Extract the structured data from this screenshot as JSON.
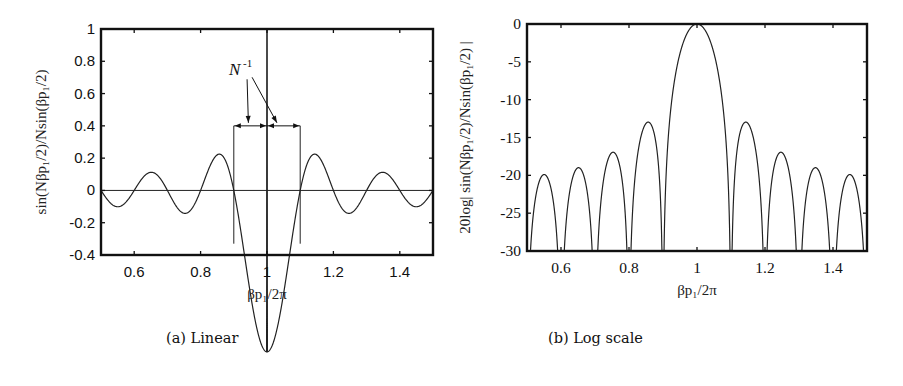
{
  "chart_data": [
    {
      "id": "linear",
      "type": "line",
      "caption": "(a) Linear",
      "xlabel": "βp₁/2π",
      "ylabel": "sin(Nβp₁/2)/Nsin(βp₁/2)",
      "xlim": [
        0.5,
        1.5
      ],
      "ylim": [
        -0.4,
        1.0
      ],
      "xticks": [
        0.6,
        0.8,
        1.0,
        1.2,
        1.4
      ],
      "xtick_labels": [
        "0.6",
        "0.8",
        "1",
        "1.2",
        "1.4"
      ],
      "yticks": [
        -0.4,
        -0.2,
        0,
        0.2,
        0.4,
        0.6,
        0.8,
        1.0
      ],
      "ytick_labels": [
        "-0.4",
        "-0.2",
        "0",
        "0.2",
        "0.4",
        "0.6",
        "0.8",
        "1"
      ],
      "grid": false,
      "N": 10,
      "series": [
        {
          "name": "array factor",
          "x": [
            0.5,
            0.55,
            0.6,
            0.65,
            0.7,
            0.75,
            0.8,
            0.85,
            0.9,
            0.95,
            1.0,
            1.05,
            1.1,
            1.15,
            1.2,
            1.25,
            1.3,
            1.35,
            1.4,
            1.45,
            1.5
          ],
          "values": [
            0.0,
            0.1,
            0.0,
            -0.11,
            0.0,
            0.14,
            0.0,
            -0.22,
            0.0,
            0.64,
            1.0,
            0.64,
            0.0,
            -0.22,
            0.0,
            0.14,
            0.0,
            -0.11,
            0.0,
            0.1,
            0.0
          ]
        }
      ],
      "annotations": [
        {
          "text": "N",
          "superscript": "-1",
          "label": "N⁻¹",
          "x": 0.94,
          "y": 0.8,
          "note": "arrows to two half-width intervals"
        },
        {
          "type": "vline",
          "x": 0.9,
          "y_range": [
            -0.33,
            0.4
          ]
        },
        {
          "type": "vline",
          "x": 1.0,
          "y_range": [
            -0.4,
            1.0
          ]
        },
        {
          "type": "vline",
          "x": 1.1,
          "y_range": [
            -0.33,
            0.4
          ]
        },
        {
          "type": "hline",
          "y": 0.0
        },
        {
          "type": "dimension",
          "x_from": 0.9,
          "x_to": 1.0,
          "y": 0.4
        },
        {
          "type": "dimension",
          "x_from": 1.0,
          "x_to": 1.1,
          "y": 0.4
        }
      ]
    },
    {
      "id": "log",
      "type": "line",
      "caption": "(b) Log scale",
      "xlabel": "βp₁/2π",
      "ylabel": "20log| sin(Nβp₁/2)/Nsin(βp₁/2) |",
      "xlim": [
        0.5,
        1.5
      ],
      "ylim": [
        -30,
        0
      ],
      "xticks": [
        0.6,
        0.8,
        1.0,
        1.2,
        1.4
      ],
      "xtick_labels": [
        "0.6",
        "0.8",
        "1",
        "1.2",
        "1.4"
      ],
      "yticks": [
        -30,
        -25,
        -20,
        -15,
        -10,
        -5,
        0
      ],
      "ytick_labels": [
        "-30",
        "-25",
        "-20",
        "-15",
        "-10",
        "-5",
        "0"
      ],
      "grid": false,
      "N": 10,
      "series": [
        {
          "name": "array factor (dB)",
          "lobe_peaks_x": [
            0.55,
            0.65,
            0.75,
            0.85,
            1.0,
            1.15,
            1.25,
            1.35,
            1.45
          ],
          "lobe_peaks_db": [
            -20.0,
            -18.8,
            -16.7,
            -13.2,
            0.0,
            -13.2,
            -16.7,
            -18.8,
            -20.0
          ],
          "nulls_x": [
            0.6,
            0.7,
            0.8,
            0.9,
            1.1,
            1.2,
            1.3,
            1.4
          ]
        }
      ]
    }
  ],
  "captions": {
    "a": "(a) Linear",
    "b": "(b) Log scale"
  },
  "labels": {
    "left_ylabel": "sin(Nβp₁/2)/Nsin(βp₁/2)",
    "right_ylabel": "20log| sin(Nβp₁/2)/Nsin(βp₁/2) |",
    "xlabel": "βp₁/2π",
    "annotation": "N⁻¹"
  },
  "colors": {
    "line": "#222222",
    "frame": "#111111",
    "background": "#ffffff"
  }
}
